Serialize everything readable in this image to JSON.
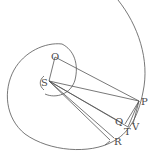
{
  "diagram": {
    "type": "geometric-figure",
    "labels": {
      "O": "O",
      "S": "S",
      "P": "P",
      "Q": "Q",
      "T": "T",
      "V": "V",
      "R": "R"
    },
    "points": {
      "O": [
        55,
        57
      ],
      "S": [
        49,
        81
      ],
      "P": [
        139,
        101
      ],
      "Q": [
        124,
        123
      ],
      "T": [
        129,
        128
      ],
      "V": [
        133,
        125
      ],
      "R": [
        110,
        142
      ]
    },
    "colors": {
      "line": "#555555",
      "text": "#4a4a4a",
      "background": "#ffffff"
    }
  }
}
